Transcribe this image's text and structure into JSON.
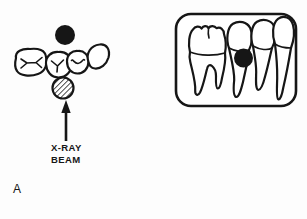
{
  "diagram": {
    "panel_label": "A",
    "beam_label_line1": "X-RAY",
    "beam_label_line2": "BEAM",
    "colors": {
      "ink": "#161616",
      "background": "#fdfdfd",
      "tooth_fill": "#ffffff"
    },
    "icons": {
      "left_black_circle": "filled-sphere-object-icon",
      "left_hatched_circle": "hatched-sphere-object-icon",
      "arrow": "up-arrow-icon",
      "film_black_circle": "filled-sphere-shadow-icon"
    }
  }
}
